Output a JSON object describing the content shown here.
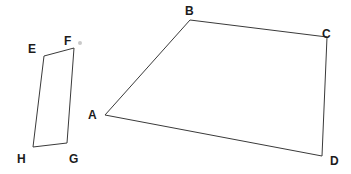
{
  "figure": {
    "width": 351,
    "height": 174,
    "background_color": "#ffffff",
    "stroke_color": "#3a3a3a",
    "stroke_width": 1,
    "label_color": "#1c1c1c"
  },
  "shapes": [
    {
      "name": "quadrilateral-abcd",
      "type": "polygon",
      "closed": true,
      "points": "105,115 190,20 327,37 322,156",
      "vertices": [
        {
          "label": "A",
          "x": 105,
          "y": 115,
          "label_x": 88,
          "label_y": 109
        },
        {
          "label": "B",
          "x": 190,
          "y": 20,
          "label_x": 185,
          "label_y": 5
        },
        {
          "label": "C",
          "x": 327,
          "y": 37,
          "label_x": 322,
          "label_y": 28
        },
        {
          "label": "D",
          "x": 322,
          "y": 156,
          "label_x": 330,
          "label_y": 155
        }
      ]
    },
    {
      "name": "quadrilateral-efgh",
      "type": "polygon",
      "closed": true,
      "points": "44,56 74,48 67,143 33,147",
      "vertices": [
        {
          "label": "E",
          "x": 44,
          "y": 56,
          "label_x": 28,
          "label_y": 43
        },
        {
          "label": "F",
          "x": 74,
          "y": 48,
          "label_x": 64,
          "label_y": 35
        },
        {
          "label": "G",
          "x": 67,
          "y": 143,
          "label_x": 69,
          "label_y": 153
        },
        {
          "label": "H",
          "x": 33,
          "y": 147,
          "label_x": 17,
          "label_y": 153
        }
      ]
    }
  ],
  "artifacts": {
    "stray_dot": {
      "x": 78,
      "y": 41
    },
    "watermark": {
      "text": "",
      "x": 255,
      "y": 110
    }
  }
}
